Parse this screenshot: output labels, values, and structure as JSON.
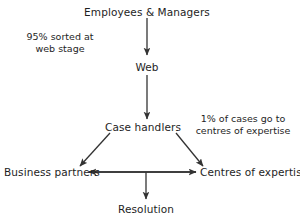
{
  "diagram": {
    "type": "flowchart",
    "background_color": "#ffffff",
    "text_color": "#1e1e1e",
    "line_color": "#333333",
    "nodes": [
      {
        "id": "employees",
        "label": "Employees & Managers"
      },
      {
        "id": "web",
        "label": "Web"
      },
      {
        "id": "case_handlers",
        "label": "Case handlers"
      },
      {
        "id": "business_partners",
        "label": "Business partners"
      },
      {
        "id": "centres",
        "label": "Centres of expertise"
      },
      {
        "id": "resolution",
        "label": "Resolution"
      }
    ],
    "annotations": [
      {
        "id": "web_stage_note",
        "line1": "95% sorted at",
        "line2": "web stage"
      },
      {
        "id": "centres_note",
        "line1": "1% of cases go to",
        "line2": "centres of expertise"
      }
    ],
    "edges": [
      {
        "from": "employees",
        "to": "web",
        "direction": "down"
      },
      {
        "from": "web",
        "to": "case_handlers",
        "direction": "down"
      },
      {
        "from": "case_handlers",
        "to": "business_partners",
        "direction": "down-left"
      },
      {
        "from": "case_handlers",
        "to": "centres",
        "direction": "down-right"
      },
      {
        "from": "centres",
        "to": "business_partners",
        "direction": "left"
      },
      {
        "from": "business_partners",
        "to": "centres",
        "direction": "right"
      },
      {
        "from": "bottom_row",
        "to": "resolution",
        "direction": "down"
      }
    ]
  }
}
